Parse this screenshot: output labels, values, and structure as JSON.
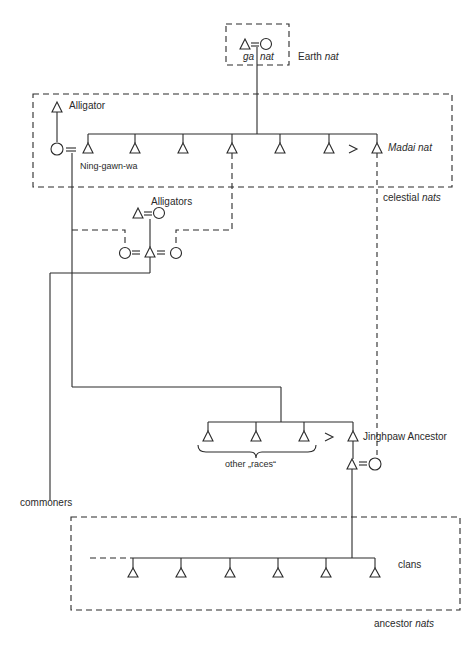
{
  "diagram": {
    "groups": {
      "earth": {
        "label_prefix": "Earth",
        "label_italic": "nat",
        "couple_labels": {
          "left": "ga",
          "right": "nat"
        }
      },
      "celestial": {
        "label_prefix": "celestial",
        "label_italic": "nats"
      },
      "ancestor": {
        "label_prefix": "ancestor",
        "label_italic": "nats"
      }
    },
    "nodes": {
      "alligator": "Alligator",
      "ning_gawn_wa": "Ning-gawn-wa",
      "madai_nat_name": "Madai",
      "madai_nat_suffix": "nat",
      "alligators": "Alligators",
      "jinghpaw_ancestor": "Jinghpaw Ancestor",
      "other_races": "other „races“",
      "commoners": "commoners",
      "clans": "clans"
    },
    "symbols": {
      "male": "triangle",
      "female": "circle",
      "marriage": "=",
      "seniority": ">"
    },
    "counts": {
      "celestial_children": 7,
      "other_races": 3,
      "clans": 6
    },
    "colors": {
      "ink": "#2a2a2a",
      "background": "#ffffff"
    }
  }
}
